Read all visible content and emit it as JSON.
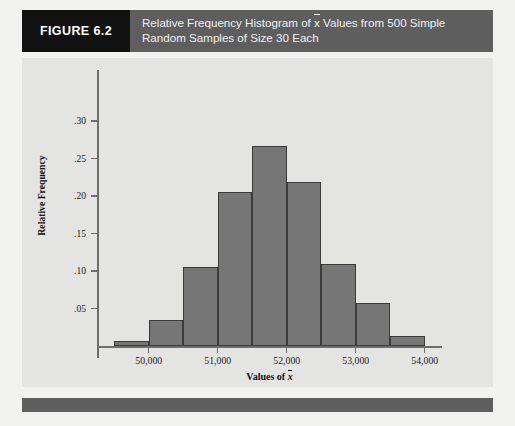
{
  "header": {
    "figure_tag": "FIGURE 6.2",
    "caption_line1_a": "Relative Frequency Histogram of ",
    "caption_xbar": "x",
    "caption_line1_b": " Values from 500 Simple",
    "caption_line2": "Random Samples of Size 30 Each"
  },
  "axis": {
    "y_title": "Relative Frequency",
    "x_title_prefix": "Values of ",
    "x_title_xbar": "x"
  },
  "chart_data": {
    "type": "bar",
    "xlabel": "Values of x̄",
    "ylabel": "Relative Frequency",
    "xlim": [
      49250,
      54250
    ],
    "ylim": [
      0,
      0.325
    ],
    "grid": false,
    "legend": null,
    "bin_width": 500,
    "bin_edges": [
      49500,
      50000,
      50500,
      51000,
      51500,
      52000,
      52500,
      53000,
      53500,
      54000,
      54250
    ],
    "categories": [
      "49,500-50,000",
      "50,000-50,500",
      "50,500-51,000",
      "51,000-51,500",
      "51,500-52,000",
      "52,000-52,500",
      "52,500-53,000",
      "53,000-53,500",
      "53,500-54,000",
      "54,000-54,250"
    ],
    "values": [
      0.007,
      0.035,
      0.106,
      0.206,
      0.267,
      0.219,
      0.11,
      0.057,
      0.013,
      0.0
    ],
    "ytick_values": [
      0.05,
      0.1,
      0.15,
      0.2,
      0.25,
      0.3
    ],
    "ytick_labels": [
      ".05",
      ".10",
      ".15",
      ".20",
      ".25",
      ".30"
    ],
    "xtick_values": [
      50000,
      51000,
      52000,
      53000,
      54000
    ],
    "xtick_labels": [
      "50,000",
      "51,000",
      "52,000",
      "53,000",
      "54,000"
    ],
    "bar_color": "#767676",
    "bar_edge_color": "#3a3a3a",
    "panel_color": "#e4e4e2"
  }
}
